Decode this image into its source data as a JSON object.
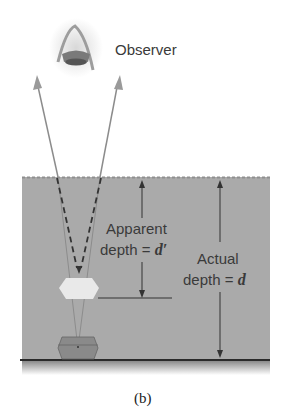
{
  "diagram": {
    "observer_label": "Observer",
    "apparent_label_line1": "Apparent",
    "apparent_label_line2_prefix": "depth = ",
    "apparent_symbol": "d′",
    "actual_label_line1": "Actual",
    "actual_label_line2_prefix": "depth = ",
    "actual_symbol": "d",
    "caption": "(b)",
    "colors": {
      "water": "#a9a9a9",
      "water_surface": "#8f8f8f",
      "ray": "#8c8c8c",
      "ray_head": "#9a9a9a",
      "arrow": "#333333",
      "object": "#7d7d7d",
      "image_object": "#e6e6e6"
    },
    "icons": [
      "eye-icon",
      "chest-object",
      "virtual-image"
    ]
  }
}
